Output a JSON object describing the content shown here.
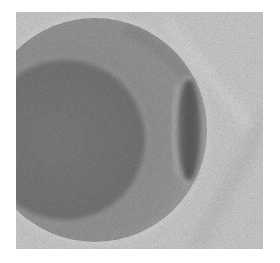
{
  "image": {
    "kind": "grayscale electron micrograph",
    "subject": "spherical particle with inner core and lateral lens-shaped bulge",
    "frame": {
      "x": 16,
      "y": 12,
      "width": 247,
      "height": 237
    },
    "colors": {
      "margin": "#ffffff",
      "background": "#c9c9c9",
      "outer_shell": "#959595",
      "inner_core": "#7a7a7a",
      "lens_bulge": "#5e5e5e",
      "shell_rim": "#b0b0b0"
    },
    "features": {
      "outer_sphere": {
        "cx": 79,
        "cy": 118,
        "r": 112
      },
      "inner_core": {
        "cx": 49,
        "cy": 128,
        "r": 80
      },
      "lens_bulge": {
        "cx": 172,
        "cy": 118,
        "rx": 13,
        "ry": 52
      }
    }
  }
}
